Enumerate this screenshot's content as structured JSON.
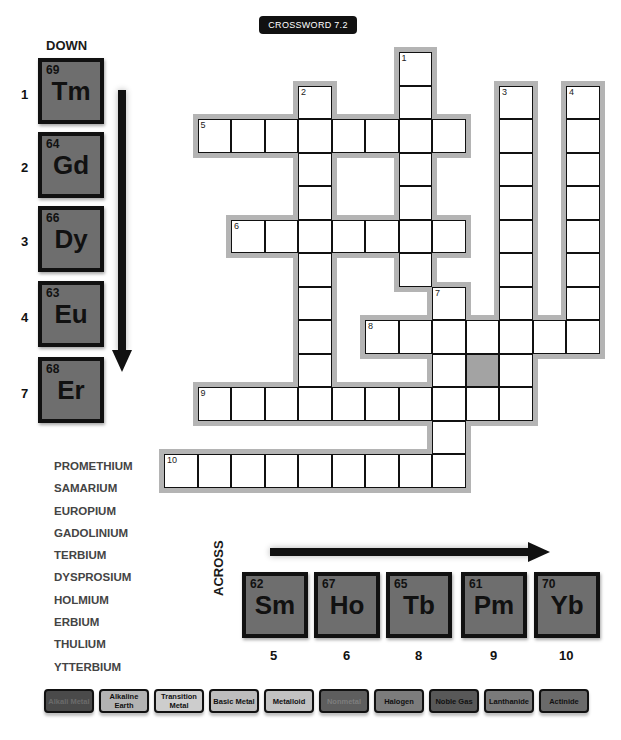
{
  "title": "CROSSWORD 7.2",
  "down": {
    "heading": "DOWN",
    "clues": [
      {
        "clue_number": "1",
        "atomic_number": "69",
        "symbol": "Tm"
      },
      {
        "clue_number": "2",
        "atomic_number": "64",
        "symbol": "Gd"
      },
      {
        "clue_number": "3",
        "atomic_number": "66",
        "symbol": "Dy"
      },
      {
        "clue_number": "4",
        "atomic_number": "63",
        "symbol": "Eu"
      },
      {
        "clue_number": "7",
        "atomic_number": "68",
        "symbol": "Er"
      }
    ]
  },
  "across": {
    "heading": "ACROSS",
    "clues": [
      {
        "clue_number": "5",
        "atomic_number": "62",
        "symbol": "Sm"
      },
      {
        "clue_number": "6",
        "atomic_number": "67",
        "symbol": "Ho"
      },
      {
        "clue_number": "8",
        "atomic_number": "65",
        "symbol": "Tb"
      },
      {
        "clue_number": "9",
        "atomic_number": "61",
        "symbol": "Pm"
      },
      {
        "clue_number": "10",
        "atomic_number": "70",
        "symbol": "Yb"
      }
    ]
  },
  "word_bank": [
    "PROMETHIUM",
    "SAMARIUM",
    "EUROPIUM",
    "GADOLINIUM",
    "TERBIUM",
    "DYSPROSIUM",
    "HOLMIUM",
    "ERBIUM",
    "THULIUM",
    "YTTERBIUM"
  ],
  "grid": {
    "cell_size": 33.5,
    "origin_x": 164,
    "origin_y": 52,
    "shaded_cells": [
      [
        9,
        9
      ]
    ],
    "entries": [
      {
        "number": "1",
        "direction": "down",
        "row": 0,
        "col": 7,
        "length": 7
      },
      {
        "number": "2",
        "direction": "down",
        "row": 1,
        "col": 4,
        "length": 10
      },
      {
        "number": "3",
        "direction": "down",
        "row": 1,
        "col": 10,
        "length": 10
      },
      {
        "number": "4",
        "direction": "down",
        "row": 1,
        "col": 12,
        "length": 8
      },
      {
        "number": "5",
        "direction": "across",
        "row": 2,
        "col": 1,
        "length": 8
      },
      {
        "number": "6",
        "direction": "across",
        "row": 5,
        "col": 2,
        "length": 7
      },
      {
        "number": "7",
        "direction": "down",
        "row": 7,
        "col": 8,
        "length": 6
      },
      {
        "number": "8",
        "direction": "across",
        "row": 8,
        "col": 6,
        "length": 7
      },
      {
        "number": "9",
        "direction": "across",
        "row": 10,
        "col": 1,
        "length": 10
      },
      {
        "number": "10",
        "direction": "across",
        "row": 12,
        "col": 0,
        "length": 9
      }
    ]
  },
  "legend": [
    {
      "label": "Alkali Metal",
      "color": "#4a4a4a",
      "text_color": "#6a6a6a"
    },
    {
      "label": "Alkaline Earth",
      "color": "#b3b3b3",
      "text_color": "#111111"
    },
    {
      "label": "Transition Metal",
      "color": "#cdcdcd",
      "text_color": "#111111"
    },
    {
      "label": "Basic Metal",
      "color": "#bdbdbd",
      "text_color": "#111111"
    },
    {
      "label": "Metalloid",
      "color": "#c2c2c2",
      "text_color": "#111111"
    },
    {
      "label": "Nonmetal",
      "color": "#5e5e5e",
      "text_color": "#7d7d7d"
    },
    {
      "label": "Halogen",
      "color": "#7c7c7c",
      "text_color": "#111111"
    },
    {
      "label": "Noble Gas",
      "color": "#585858",
      "text_color": "#111111"
    },
    {
      "label": "Lanthanide",
      "color": "#7a7a7a",
      "text_color": "#111111"
    },
    {
      "label": "Actinide",
      "color": "#6a6a6a",
      "text_color": "#111111"
    }
  ],
  "colors": {
    "tile_fill": "#6e6e6e",
    "tile_border": "#111111",
    "grid_halo": "#b4b4b4",
    "shaded_cell": "#a3a3a3"
  }
}
